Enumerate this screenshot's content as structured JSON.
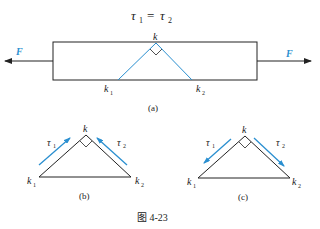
{
  "equation": {
    "tau1": "τ",
    "sub1": "1",
    "eq": "=",
    "tau2": "τ",
    "sub2": "2"
  },
  "fig_a": {
    "force_left": "F",
    "force_right": "F",
    "vertex": "k",
    "left_point": "k",
    "left_sub": "1",
    "right_point": "k",
    "right_sub": "2",
    "caption": "(a)"
  },
  "fig_b": {
    "vertex": "k",
    "left_point": "k",
    "left_sub": "1",
    "right_point": "k",
    "right_sub": "2",
    "tau_left": "τ",
    "tau_left_sub": "1",
    "tau_right": "τ",
    "tau_right_sub": "2",
    "caption": "(b)"
  },
  "fig_c": {
    "vertex": "k",
    "left_point": "k",
    "left_sub": "1",
    "right_point": "k",
    "right_sub": "2",
    "tau_left": "τ",
    "tau_left_sub": "1",
    "tau_right": "τ",
    "tau_right_sub": "2",
    "caption": "(c)"
  },
  "figure_caption": "图 4-23",
  "colors": {
    "line": "#222222",
    "accent": "#2a8fd0"
  }
}
